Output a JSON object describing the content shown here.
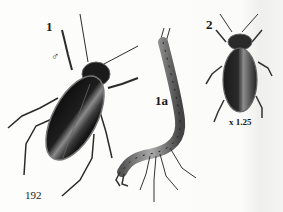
{
  "plate": {
    "labels": {
      "fig1": "1",
      "fig1a": "1a",
      "fig2": "2",
      "male_symbol": "♂",
      "scale": "x 1.25",
      "page_number": "192"
    },
    "figures": [
      {
        "id": "1",
        "subject": "adult water beetle (male), dorsal view"
      },
      {
        "id": "1a",
        "subject": "beetle larva"
      },
      {
        "id": "2",
        "subject": "smaller water beetle, dorsal view"
      }
    ],
    "colors": {
      "background": "#fbfbf9",
      "ink": "#1a1a1a",
      "shell_dark": "#111111",
      "shell_highlight": "#9a9a9a"
    }
  }
}
